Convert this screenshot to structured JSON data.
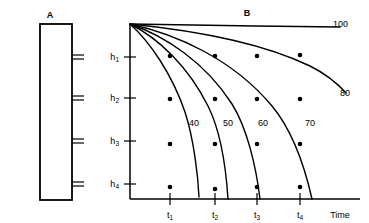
{
  "figure": {
    "panels": [
      {
        "id": "A",
        "label": "A",
        "type": "rectangle-diagram"
      },
      {
        "id": "B",
        "label": "B",
        "type": "chart"
      }
    ]
  },
  "panel_a": {
    "label": "A",
    "rect": {
      "x": 40,
      "y": 24,
      "width": 32,
      "height": 176
    },
    "tick_pairs": [
      {
        "name": "tick-pair-1",
        "y": 57
      },
      {
        "name": "tick-pair-2",
        "y": 98
      },
      {
        "name": "tick-pair-3",
        "y": 141
      },
      {
        "name": "tick-pair-4",
        "y": 184
      }
    ]
  },
  "chart_data": {
    "type": "line",
    "title": "B",
    "xlabel": "Time",
    "ylabel": "",
    "grid": false,
    "legend": "inline-curve-labels",
    "x_tick_labels": [
      "t1",
      "t2",
      "t3",
      "t4"
    ],
    "x_tick_display": [
      "t",
      "t",
      "t",
      "t"
    ],
    "x_tick_subscripts": [
      "1",
      "2",
      "3",
      "4"
    ],
    "x_axis_end_label": "Time",
    "y_tick_labels": [
      "h1",
      "h2",
      "h3",
      "h4"
    ],
    "y_tick_display": [
      "h",
      "h",
      "h",
      "h"
    ],
    "y_tick_subscripts": [
      "1",
      "2",
      "3",
      "4"
    ],
    "x_tick_positions_px": [
      170,
      215,
      257,
      300
    ],
    "y_tick_positions_px": [
      57,
      98,
      141,
      184
    ],
    "plot_box_px": {
      "left": 130,
      "top": 24,
      "right": 360,
      "bottom": 199
    },
    "series": [
      {
        "name": "100",
        "label": "100",
        "label_pos_px": {
          "x": 333,
          "y": 27
        },
        "path": "M130,24 L255,26 L340,27",
        "description": "nearly flat horizontal line across top"
      },
      {
        "name": "80",
        "label": "80",
        "label_pos_px": {
          "x": 340,
          "y": 96
        },
        "path": "M130,24 C190,30 260,42 310,66 C326,74 338,84 346,93",
        "description": "gentle decay ending mid-plot at right"
      },
      {
        "name": "70",
        "label": "70",
        "label_pos_px": {
          "x": 310,
          "y": 126
        },
        "path": "M130,24 C175,34 232,58 272,106 C292,130 305,168 312,199",
        "description": "decays to x-axis near t4 plus offset"
      },
      {
        "name": "60",
        "label": "60",
        "label_pos_px": {
          "x": 263,
          "y": 126
        },
        "path": "M130,24 C165,36 205,62 232,104 C247,128 256,166 260,199",
        "description": "decays to x-axis just past t3"
      },
      {
        "name": "50",
        "label": "50",
        "label_pos_px": {
          "x": 228,
          "y": 126
        },
        "path": "M130,24 C158,38 188,66 208,106 C220,130 226,168 228,199",
        "description": "decays to x-axis just past t2"
      },
      {
        "name": "40",
        "label": "40",
        "label_pos_px": {
          "x": 194,
          "y": 126
        },
        "path": "M130,24 C150,42 172,74 185,112 C194,140 198,176 199,197",
        "description": "steepest decay, reaches x-axis at t2"
      }
    ],
    "data_points": [
      {
        "x_label": "t1",
        "y_label": "h1",
        "px": {
          "x": 170,
          "y": 56
        }
      },
      {
        "x_label": "t2",
        "y_label": "h1",
        "px": {
          "x": 215,
          "y": 56
        }
      },
      {
        "x_label": "t3",
        "y_label": "h1",
        "px": {
          "x": 257,
          "y": 56
        }
      },
      {
        "x_label": "t4",
        "y_label": "h1",
        "px": {
          "x": 300,
          "y": 55
        }
      },
      {
        "x_label": "t1",
        "y_label": "h2",
        "px": {
          "x": 170,
          "y": 99
        }
      },
      {
        "x_label": "t2",
        "y_label": "h2",
        "px": {
          "x": 215,
          "y": 99
        }
      },
      {
        "x_label": "t3",
        "y_label": "h2",
        "px": {
          "x": 257,
          "y": 99
        }
      },
      {
        "x_label": "t4",
        "y_label": "h2",
        "px": {
          "x": 300,
          "y": 99
        }
      },
      {
        "x_label": "t1",
        "y_label": "h3",
        "px": {
          "x": 170,
          "y": 144
        }
      },
      {
        "x_label": "t2",
        "y_label": "h3",
        "px": {
          "x": 215,
          "y": 144
        }
      },
      {
        "x_label": "t3",
        "y_label": "h3",
        "px": {
          "x": 257,
          "y": 144
        }
      },
      {
        "x_label": "t4",
        "y_label": "h3",
        "px": {
          "x": 300,
          "y": 144
        }
      },
      {
        "x_label": "t1",
        "y_label": "h4",
        "px": {
          "x": 170,
          "y": 187
        }
      },
      {
        "x_label": "t2",
        "y_label": "h4",
        "px": {
          "x": 215,
          "y": 189
        }
      },
      {
        "x_label": "t3",
        "y_label": "h4",
        "px": {
          "x": 257,
          "y": 187
        }
      },
      {
        "x_label": "t4",
        "y_label": "h4",
        "px": {
          "x": 300,
          "y": 187
        }
      }
    ]
  },
  "colors": {
    "ink": "#000000",
    "background": "#ffffff"
  }
}
